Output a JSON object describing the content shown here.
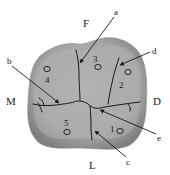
{
  "diagram": {
    "type": "tooth-occlusal-surface",
    "directions": {
      "top": "F",
      "left": "M",
      "right": "D",
      "bottom": "L"
    },
    "cusps": [
      {
        "id": "1",
        "label": "1"
      },
      {
        "id": "2",
        "label": "2"
      },
      {
        "id": "3",
        "label": "3"
      },
      {
        "id": "4",
        "label": "4"
      },
      {
        "id": "5",
        "label": "5"
      }
    ],
    "pointers": [
      {
        "id": "a",
        "label": "a"
      },
      {
        "id": "b",
        "label": "b"
      },
      {
        "id": "c",
        "label": "c"
      },
      {
        "id": "d",
        "label": "d"
      },
      {
        "id": "e",
        "label": "e"
      }
    ],
    "colors": {
      "tooth_fill": "#a8a8a8",
      "tooth_rim": "#7a7a7a",
      "line": "#1a1a1a",
      "background": "#ffffff"
    }
  }
}
